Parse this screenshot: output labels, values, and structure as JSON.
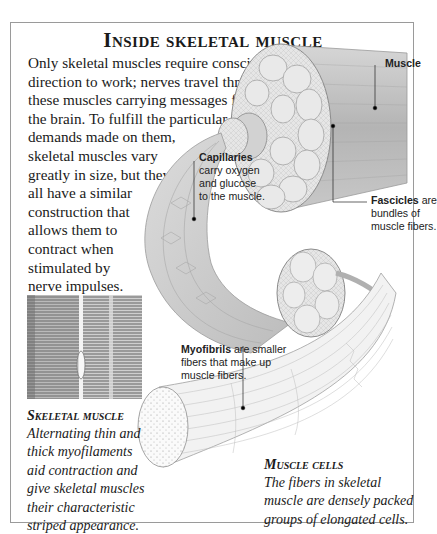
{
  "title": "Inside skeletal muscle",
  "intro_lines": [
    "Only skeletal muscles require conscious",
    "direction to work; nerves travel through",
    "these muscles carrying messages from",
    "the brain. To fulfill the particular",
    "demands made on them,",
    "skeletal muscles vary",
    "greatly in size, but they",
    "all have a similar",
    "construction that",
    "allows them to",
    "contract when",
    "stimulated by",
    "nerve impulses."
  ],
  "labels": {
    "muscle": {
      "term": "Muscle",
      "text": ""
    },
    "capillaries": {
      "term": "Capillaries",
      "text": "carry oxygen\nand glucose\nto the muscle."
    },
    "fascicles": {
      "term": "Fascicles",
      "text": " are\nbundles of\nmuscle fibers."
    },
    "myofibrils": {
      "term": "Myofibrils",
      "text": " are smaller\nfibers that make up\nmuscle fibers."
    }
  },
  "captions": {
    "skeletal_muscle": {
      "title": "Skeletal muscle",
      "body": "Alternating thin and\nthick myofilaments\naid contraction and\ngive skeletal muscles\ntheir characteristic\nstriped appearance."
    },
    "muscle_cells": {
      "title": "Muscle cells",
      "body": "The fibers in skeletal\nmuscle are densely packed\ngroups of elongated cells."
    }
  },
  "colors": {
    "frame_border": "#9a9a9a",
    "muscle_shade": "#b8b8b8",
    "muscle_light": "#e4e4e4",
    "outline": "#8a8a8a",
    "micrograph_dark": "#6e6e6e",
    "micrograph_light": "#c8c8c8"
  }
}
